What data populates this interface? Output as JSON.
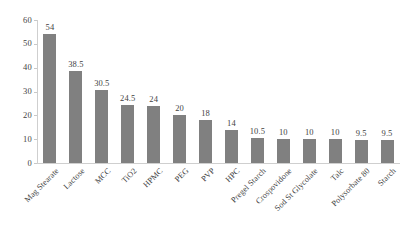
{
  "chart_data": {
    "type": "bar",
    "title": "",
    "subtitle": "",
    "xlabel": "",
    "ylabel": "",
    "ylim": [
      0,
      60
    ],
    "yticks": [
      0,
      10,
      20,
      30,
      40,
      50,
      60
    ],
    "grid": false,
    "legend": false,
    "legend_position": "none",
    "bar_color": "#808080",
    "axis_color": "#cfcfcf",
    "text_color": "#3f3f3f",
    "categories": [
      "Mag Stearate",
      "Lactose",
      "MCC",
      "TiO2",
      "HPMC",
      "PEG",
      "PVP",
      "HPC",
      "Pregel Starch",
      "Crospovidone",
      "Sod St Glycolate",
      "Talc",
      "Polysorbate 80",
      "Starch"
    ],
    "values": [
      54,
      38.5,
      30.5,
      24.5,
      24,
      20,
      18,
      14,
      10.5,
      10,
      10,
      10,
      9.5,
      9.5
    ],
    "data_labels": [
      "54",
      "38.5",
      "30.5",
      "24.5",
      "24",
      "20",
      "18",
      "14",
      "10.5",
      "10",
      "10",
      "10",
      "9.5",
      "9.5"
    ],
    "ytick_labels": [
      "0",
      "10",
      "20",
      "30",
      "40",
      "50",
      "60"
    ]
  }
}
